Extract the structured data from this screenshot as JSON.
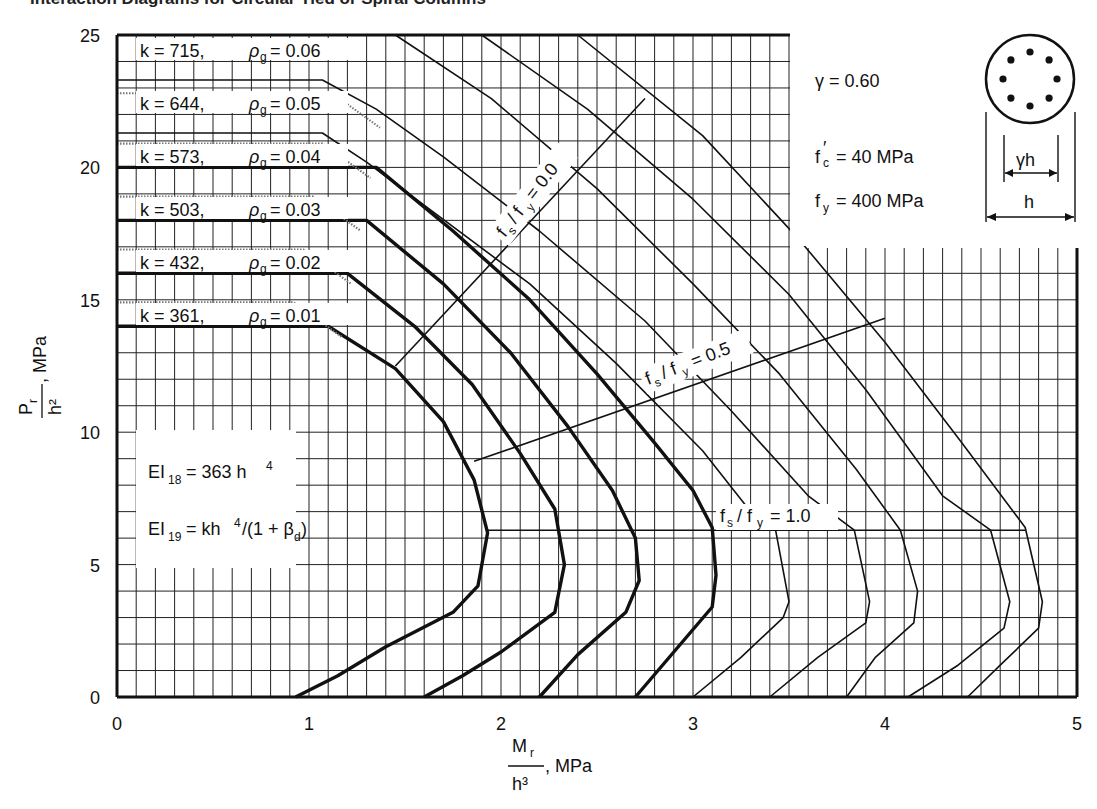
{
  "header": {
    "title_fragment": "Interaction Diagrams for Circular Tied or Spiral Columns"
  },
  "parameters": {
    "gamma": "γ  = 0.60",
    "fc": "= 40  MPa",
    "fy": "= 400  MPa",
    "fc_symbol": "f′c",
    "fy_symbol": "fy",
    "section_dim_inner": "γh",
    "section_dim_outer": "h",
    "section_bar_count": 8
  },
  "stiffness": {
    "ei18_lhs": "EI",
    "ei18_sub": "18",
    "ei18_rhs": "= 363 h",
    "ei18_sup": "4",
    "ei19_lhs": "EI",
    "ei19_sub": "19",
    "ei19_rhs": "= kh",
    "ei19_sup": "4",
    "ei19_tail": "/(1 + β",
    "ei19_tail_sub": "d",
    "ei19_close": ")"
  },
  "axes": {
    "x_label_num": "M",
    "x_label_num_sub": "r",
    "x_label_den": "h³",
    "x_label_unit": ", MPa",
    "y_label_num": "P",
    "y_label_num_sub": "r",
    "y_label_den": "h²",
    "y_label_unit": ", MPa"
  },
  "chart_data": {
    "type": "line",
    "xlabel": "Mr / h³, MPa",
    "ylabel": "Pr / h², MPa",
    "xlim": [
      0,
      5
    ],
    "ylim": [
      0,
      25
    ],
    "x_ticks": [
      0,
      1,
      2,
      3,
      4,
      5
    ],
    "y_ticks": [
      0,
      5,
      10,
      15,
      20,
      25
    ],
    "grid": {
      "x_step": 0.1,
      "y_step": 1
    },
    "series": [
      {
        "name": "k = 361, ρg = 0.01",
        "k": 361,
        "rho_g": 0.01,
        "weight": "thick",
        "points": [
          [
            0,
            14
          ],
          [
            1.1,
            14
          ],
          [
            1.45,
            12.4
          ],
          [
            1.7,
            10.4
          ],
          [
            1.86,
            8.2
          ],
          [
            1.93,
            6.2
          ],
          [
            1.88,
            4.2
          ],
          [
            1.75,
            3.2
          ],
          [
            1.4,
            1.9
          ],
          [
            1.15,
            0.8
          ],
          [
            0.93,
            0
          ]
        ]
      },
      {
        "name": "k = 432, ρg = 0.02",
        "k": 432,
        "rho_g": 0.02,
        "weight": "thick",
        "points": [
          [
            0,
            16
          ],
          [
            1.2,
            16
          ],
          [
            1.55,
            14
          ],
          [
            1.85,
            11.8
          ],
          [
            2.1,
            9.2
          ],
          [
            2.28,
            7.1
          ],
          [
            2.33,
            5.0
          ],
          [
            2.28,
            3.2
          ],
          [
            2.0,
            1.7
          ],
          [
            1.8,
            0.8
          ],
          [
            1.6,
            0
          ]
        ]
      },
      {
        "name": "k = 503, ρg = 0.03",
        "k": 503,
        "rho_g": 0.03,
        "weight": "thick",
        "points": [
          [
            0,
            18
          ],
          [
            1.3,
            18
          ],
          [
            1.7,
            15.6
          ],
          [
            2.05,
            13
          ],
          [
            2.35,
            10.2
          ],
          [
            2.58,
            7.8
          ],
          [
            2.7,
            6.0
          ],
          [
            2.72,
            4.4
          ],
          [
            2.65,
            3.2
          ],
          [
            2.4,
            1.6
          ],
          [
            2.2,
            0
          ]
        ]
      },
      {
        "name": "k = 573, ρg = 0.04",
        "k": 573,
        "rho_g": 0.04,
        "weight": "thick",
        "points": [
          [
            0,
            20
          ],
          [
            1.35,
            20
          ],
          [
            1.75,
            17.6
          ],
          [
            2.15,
            15
          ],
          [
            2.5,
            12.2
          ],
          [
            2.8,
            9.6
          ],
          [
            3.0,
            7.8
          ],
          [
            3.1,
            6.4
          ],
          [
            3.12,
            4.6
          ],
          [
            3.1,
            3.4
          ],
          [
            2.9,
            1.7
          ],
          [
            2.7,
            0
          ]
        ]
      },
      {
        "name": "k = 644, ρg = 0.05",
        "k": 644,
        "rho_g": 0.05,
        "weight": "thin",
        "points": [
          [
            0,
            21.3
          ],
          [
            1.07,
            21.3
          ],
          [
            1.3,
            20.2
          ],
          [
            1.65,
            18.3
          ],
          [
            2.15,
            15.6
          ],
          [
            2.6,
            12.6
          ],
          [
            3.05,
            9.3
          ],
          [
            3.3,
            7.0
          ],
          [
            3.43,
            6.3
          ],
          [
            3.5,
            3.6
          ],
          [
            3.47,
            3.0
          ],
          [
            3.25,
            1.5
          ],
          [
            3.0,
            0
          ]
        ]
      },
      {
        "name": "k = 715, ρg = 0.06",
        "k": 715,
        "rho_g": 0.06,
        "weight": "thin",
        "points": [
          [
            0,
            23.3
          ],
          [
            1.07,
            23.3
          ],
          [
            1.35,
            22.2
          ],
          [
            1.7,
            20.4
          ],
          [
            2.2,
            17.6
          ],
          [
            2.75,
            14.2
          ],
          [
            3.2,
            10.8
          ],
          [
            3.6,
            7.6
          ],
          [
            3.84,
            6.3
          ],
          [
            3.92,
            3.6
          ],
          [
            3.9,
            2.8
          ],
          [
            3.65,
            1.5
          ],
          [
            3.4,
            0
          ]
        ]
      },
      {
        "name": "ρg = 0.07",
        "rho_g": 0.07,
        "weight": "thin",
        "points": [
          [
            1.45,
            25
          ],
          [
            1.95,
            22.6
          ],
          [
            2.5,
            19.2
          ],
          [
            3.0,
            15.6
          ],
          [
            3.45,
            12.2
          ],
          [
            3.85,
            8.6
          ],
          [
            4.08,
            6.3
          ],
          [
            4.17,
            4.0
          ],
          [
            4.15,
            2.8
          ],
          [
            3.95,
            1.5
          ],
          [
            3.8,
            0
          ]
        ]
      },
      {
        "name": "ρg = 0.08",
        "rho_g": 0.08,
        "weight": "thin",
        "points": [
          [
            1.9,
            25
          ],
          [
            2.45,
            22.2
          ],
          [
            3.0,
            18.8
          ],
          [
            3.5,
            15.2
          ],
          [
            3.9,
            11.6
          ],
          [
            4.3,
            7.6
          ],
          [
            4.55,
            6.3
          ],
          [
            4.65,
            3.6
          ],
          [
            4.62,
            2.6
          ],
          [
            4.38,
            1.2
          ],
          [
            4.12,
            0
          ]
        ]
      },
      {
        "name": "ρg = 0.09",
        "rho_g": 0.09,
        "weight": "thin",
        "points": [
          [
            2.4,
            25
          ],
          [
            3.05,
            21.2
          ],
          [
            3.55,
            17.3
          ],
          [
            4.0,
            13.4
          ],
          [
            4.4,
            9.6
          ],
          [
            4.73,
            6.4
          ],
          [
            4.82,
            3.6
          ],
          [
            4.8,
            2.6
          ],
          [
            4.6,
            1.2
          ],
          [
            4.43,
            0
          ]
        ]
      }
    ],
    "stress_lines": [
      {
        "name": "fs / fy = 0.0",
        "points": [
          [
            1.45,
            12.5
          ],
          [
            2.75,
            22.6
          ]
        ]
      },
      {
        "name": "fs / fy = 0.5",
        "points": [
          [
            1.86,
            8.9
          ],
          [
            4.0,
            14.3
          ]
        ]
      },
      {
        "name": "fs / fy = 1.0",
        "points": [
          [
            1.93,
            6.3
          ],
          [
            4.73,
            6.3
          ]
        ]
      }
    ],
    "annotations": [
      "k = 715, ρg = 0.06",
      "k = 644, ρg = 0.05",
      "k = 573, ρg = 0.04",
      "k = 503, ρg = 0.03",
      "k = 432, ρg = 0.02",
      "k = 361, ρg = 0.01",
      "γ = 0.60",
      "f'c = 40 MPa",
      "fy = 400 MPa",
      "EI18 = 363 h^4",
      "EI19 = kh^4/(1 + βd)"
    ],
    "legend_position": "inline labels"
  },
  "curve_labels": [
    {
      "k": "k  =  715,",
      "rho": "= 0.06"
    },
    {
      "k": "k  =  644,",
      "rho": "= 0.05"
    },
    {
      "k": "k  =  573,",
      "rho": "= 0.04"
    },
    {
      "k": "k  =  503,",
      "rho": "= 0.03"
    },
    {
      "k": "k  =  432,",
      "rho": "= 0.02"
    },
    {
      "k": "k  =  361,",
      "rho": "= 0.01"
    }
  ],
  "stress_labels": {
    "s00": "= 0.0",
    "s05": "= 0.5",
    "s10": "= 1.0"
  }
}
